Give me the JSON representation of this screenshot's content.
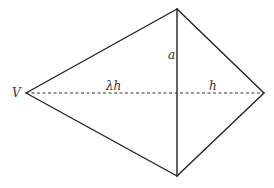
{
  "diagram": {
    "type": "kite-shaped quadrilateral with diagonals",
    "vertices": {
      "V": [
        26,
        93
      ],
      "top": [
        177,
        9
      ],
      "bottom": [
        177,
        176
      ],
      "right": [
        264,
        93
      ]
    },
    "labels": {
      "vertex_v": "V",
      "vertical_segment": "a",
      "left_horizontal_segment": "λh",
      "right_horizontal_segment": "h"
    },
    "colors": {
      "stroke": "#222222",
      "text": "#333333",
      "background": "#ffffff"
    }
  }
}
